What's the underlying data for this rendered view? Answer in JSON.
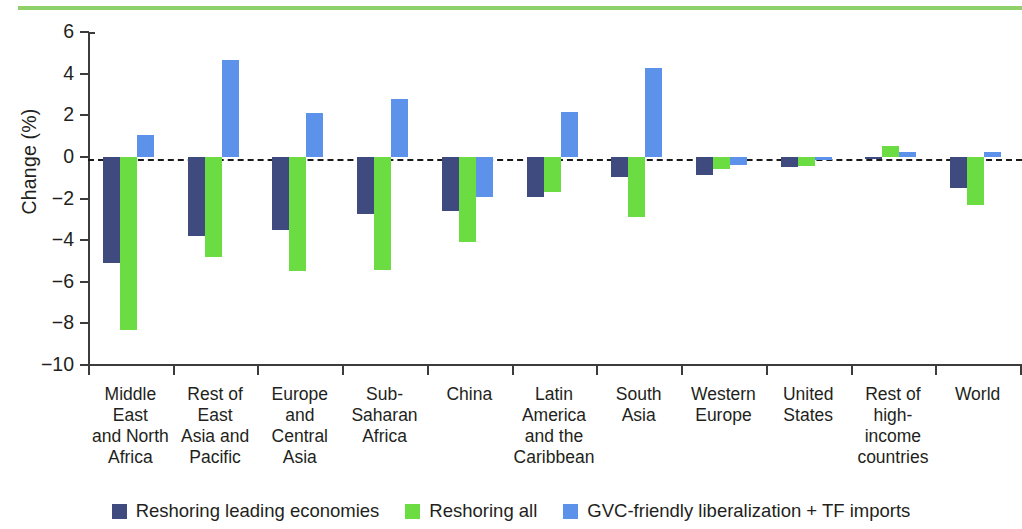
{
  "figure": {
    "accent_rule_color": "#8ed06a"
  },
  "chart_data": {
    "type": "bar",
    "title": "",
    "subtitle": "",
    "xlabel": "",
    "ylabel": "Change (%)",
    "ylim": [
      -10,
      6
    ],
    "yticks": [
      6,
      4,
      2,
      0,
      -2,
      -4,
      -6,
      -8,
      -10
    ],
    "ytick_labels": [
      "6",
      "4",
      "2",
      "0",
      "−2",
      "−4",
      "−6",
      "−8",
      "−10"
    ],
    "grid": false,
    "zero_line": true,
    "legend_position": "bottom",
    "categories": [
      "Middle East and North Africa",
      "Rest of East Asia and Pacific",
      "Europe and Central Asia",
      "Sub-Saharan Africa",
      "China",
      "Latin America and the Caribbean",
      "South Asia",
      "Western Europe",
      "United States",
      "Rest of high-income countries",
      "World"
    ],
    "category_label_lines": [
      [
        "Middle",
        "East",
        "and North",
        "Africa"
      ],
      [
        "Rest of",
        "East",
        "Asia and",
        "Pacific"
      ],
      [
        "Europe",
        "and",
        "Central",
        "Asia"
      ],
      [
        "Sub-",
        "Saharan",
        "Africa"
      ],
      [
        "China"
      ],
      [
        "Latin",
        "America",
        "and the",
        "Caribbean"
      ],
      [
        "South",
        "Asia"
      ],
      [
        "Western",
        "Europe"
      ],
      [
        "United",
        "States"
      ],
      [
        "Rest of",
        "high-income",
        "countries"
      ],
      [
        "World"
      ]
    ],
    "series": [
      {
        "name": "Reshoring leading economies",
        "color": "#3f4a7e",
        "values": [
          -5.1,
          -3.8,
          -3.5,
          -2.75,
          -2.6,
          -1.95,
          -0.95,
          -0.85,
          -0.5,
          -0.1,
          -1.5
        ]
      },
      {
        "name": "Reshoring all",
        "color": "#6bdd42",
        "values": [
          -8.3,
          -4.8,
          -5.5,
          -5.45,
          -4.1,
          -1.7,
          -2.9,
          -0.6,
          -0.45,
          0.5,
          -2.3
        ]
      },
      {
        "name": "GVC-friendly liberalization + TF imports",
        "color": "#5d92ea",
        "values": [
          1.05,
          4.65,
          2.1,
          2.8,
          -1.95,
          2.15,
          4.25,
          -0.4,
          -0.15,
          0.25,
          0.25
        ]
      }
    ]
  },
  "legend": {
    "items": [
      {
        "label": "Reshoring leading economies",
        "color": "#3f4a7e"
      },
      {
        "label": "Reshoring all",
        "color": "#6bdd42"
      },
      {
        "label": "GVC-friendly liberalization + TF imports",
        "color": "#5d92ea"
      }
    ]
  }
}
